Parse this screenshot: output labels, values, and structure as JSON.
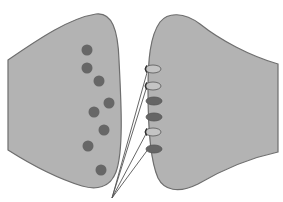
{
  "diagram": {
    "type": "synapse",
    "colors": {
      "cell_fill": "#b3b3b3",
      "cell_stroke": "#6e6e6e",
      "vesicle_fill": "#676767",
      "receptor_light": "#c4c4c4",
      "receptor_dark": "#656565",
      "pointer_line": "#555555",
      "background": "#ffffff"
    },
    "presynaptic": {
      "label": "",
      "vesicle_count": 8
    },
    "vesicles": [
      {
        "cx": 87,
        "cy": 50
      },
      {
        "cx": 87,
        "cy": 68
      },
      {
        "cx": 99,
        "cy": 81
      },
      {
        "cx": 109,
        "cy": 103
      },
      {
        "cx": 94,
        "cy": 112
      },
      {
        "cx": 104,
        "cy": 130
      },
      {
        "cx": 88,
        "cy": 146
      },
      {
        "cx": 101,
        "cy": 170
      }
    ],
    "receptors": [
      {
        "cx": 153,
        "cy": 69,
        "state": "open"
      },
      {
        "cx": 153,
        "cy": 86,
        "state": "open"
      },
      {
        "cx": 154,
        "cy": 101,
        "state": "bound"
      },
      {
        "cx": 154,
        "cy": 117,
        "state": "bound"
      },
      {
        "cx": 153,
        "cy": 132,
        "state": "open"
      },
      {
        "cx": 154,
        "cy": 149,
        "state": "bound"
      }
    ],
    "pointer_origin": {
      "x": 112,
      "y": 198
    },
    "pointer_targets": [
      {
        "x": 148,
        "y": 69
      },
      {
        "x": 147,
        "y": 86
      },
      {
        "x": 147,
        "y": 132
      },
      {
        "x": 149,
        "y": 148
      }
    ]
  }
}
